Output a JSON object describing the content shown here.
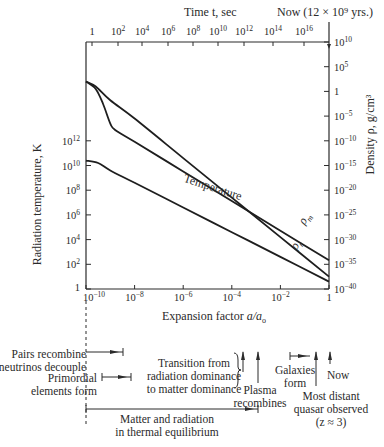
{
  "chart_data": {
    "type": "line",
    "title": "",
    "top_axis": {
      "label": "Time t, sec",
      "ticks": [
        "1",
        "10^2",
        "10^4",
        "10^6",
        "10^8",
        "10^10",
        "10^12",
        "10^14",
        "10^16"
      ],
      "tick_exponents": [
        0,
        2,
        4,
        6,
        8,
        10,
        12,
        14,
        16
      ],
      "now_label": "Now (12 × 10^9 yrs.)"
    },
    "xlabel": "Expansion factor a/a₀",
    "x_scale": "log",
    "x_ticks": [
      "10^-10",
      "10^-8",
      "10^-6",
      "10^-4",
      "10^-2",
      "1"
    ],
    "x_tick_exponents": [
      -10,
      -8,
      -6,
      -4,
      -2,
      0
    ],
    "xlim_exponent": [
      -10,
      0
    ],
    "ylabel_left": "Radiation temperature, K",
    "y_left_scale": "log",
    "y_left_ticks": [
      "1",
      "10^2",
      "10^4",
      "10^6",
      "10^8",
      "10^10",
      "10^12"
    ],
    "y_left_tick_exponents": [
      0,
      2,
      4,
      6,
      8,
      10,
      12
    ],
    "ylim_left_exponent": [
      0,
      20
    ],
    "ylabel_right": "Density ρ, g/cm³",
    "y_right_scale": "log",
    "y_right_ticks": [
      "10^-40",
      "10^-35",
      "10^-30",
      "10^-25",
      "10^-20",
      "10^-15",
      "10^-10",
      "10^-5",
      "1",
      "10^5",
      "10^10"
    ],
    "y_right_tick_exponents": [
      -40,
      -35,
      -30,
      -25,
      -20,
      -15,
      -10,
      -5,
      0,
      5,
      10
    ],
    "ylim_right_exponent": [
      -40,
      10
    ],
    "grid": false,
    "series": [
      {
        "name": "Temperature",
        "axis": "left",
        "x_log": [
          -10,
          -9.5,
          -9,
          -8,
          -6,
          -4,
          -2,
          0
        ],
        "y_log": [
          10.4,
          10.2,
          9.6,
          8.6,
          6.6,
          4.6,
          2.6,
          0.6
        ]
      },
      {
        "name": "ρm",
        "axis": "right",
        "x_log": [
          -10,
          -9.6,
          -9.3,
          -9.0,
          -8.8,
          -8,
          -6,
          -4,
          -2,
          0
        ],
        "y_log": [
          2,
          0.5,
          -2.5,
          -6.5,
          -7.8,
          -10.2,
          -16.2,
          -22.2,
          -28.2,
          -34.2
        ]
      },
      {
        "name": "ρr",
        "axis": "right",
        "x_log": [
          -10,
          -9.6,
          -9,
          -8,
          -6,
          -4,
          -2,
          0
        ],
        "y_log": [
          2,
          1,
          -1.8,
          -5.5,
          -13.5,
          -21.5,
          -29.5,
          -37.5
        ]
      }
    ],
    "series_labels": {
      "temperature": "Temperature",
      "rho_m": "ρm",
      "rho_r": "ρr"
    },
    "annotations": [
      {
        "text": "Pairs recombine\nneutrinos decouple",
        "type": "range",
        "x_log": [
          -10,
          -9.1
        ]
      },
      {
        "text": "Primordial\nelements form",
        "type": "range",
        "x_log": [
          -9.55,
          -8.7
        ]
      },
      {
        "text": "Transition from\nradiation dominance\nto matter dominance",
        "type": "arrow",
        "x_log": -3.9
      },
      {
        "text": "Plasma\nrecombines",
        "type": "arrow",
        "x_log": -3.0
      },
      {
        "text": "Galaxies\nform",
        "type": "range",
        "x_log": [
          -1.2,
          -0.6
        ]
      },
      {
        "text": "Most distant\nquasar observed\n(z ≈ 3)",
        "type": "arrow",
        "x_log": -0.6
      },
      {
        "text": "Now",
        "type": "arrow",
        "x_log": 0
      },
      {
        "text": "Matter and radiation\nin thermal equilibrium",
        "type": "range",
        "x_log": [
          -10,
          -3.0
        ]
      }
    ]
  },
  "labels": {
    "time_axis": "Time t, sec",
    "now_top": "Now (12 × 10⁹ yrs.)",
    "xlabel_main": "Expansion factor ",
    "xlabel_italic": "a/a",
    "xlabel_sub": "o",
    "ylabel_left": "Radiation temperature, K",
    "ylabel_right": "Density ρ, g/cm³",
    "pairs": "Pairs recombine",
    "neutrinos": "neutrinos decouple",
    "primordial_1": "Primordial",
    "primordial_2": "elements form",
    "transition_1": "Transition from",
    "transition_2": "radiation dominance",
    "transition_3": "to matter dominance",
    "plasma_1": "Plasma",
    "plasma_2": "recombines",
    "galaxies_1": "Galaxies",
    "galaxies_2": "form",
    "now_bottom": "Now",
    "quasar_1": "Most distant",
    "quasar_2": "quasar observed",
    "quasar_3": "(z ≈ 3)",
    "equilibrium_1": "Matter and radiation",
    "equilibrium_2": "in thermal equilibrium"
  }
}
